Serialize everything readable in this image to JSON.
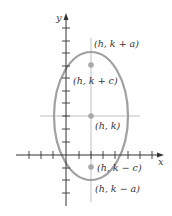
{
  "diagram": {
    "type": "vertical-ellipse",
    "axes": {
      "x_label": "x",
      "y_label": "y",
      "color": "#333333"
    },
    "ellipse": {
      "color": "#9a9a9a",
      "center_px": [
        91,
        116
      ],
      "rx_px": 37,
      "ry_px": 64
    },
    "guide_lines_color": "#b0b0b0",
    "point_color": "#a8a8a8",
    "points": [
      {
        "id": "vertex-top",
        "label": "(h, k + a)"
      },
      {
        "id": "focus-top",
        "label": "(h, k + c)"
      },
      {
        "id": "center",
        "label": "(h, k)"
      },
      {
        "id": "focus-bottom",
        "label": "(h, k − c)"
      },
      {
        "id": "vertex-bottom",
        "label": "(h, k − a)"
      }
    ]
  }
}
